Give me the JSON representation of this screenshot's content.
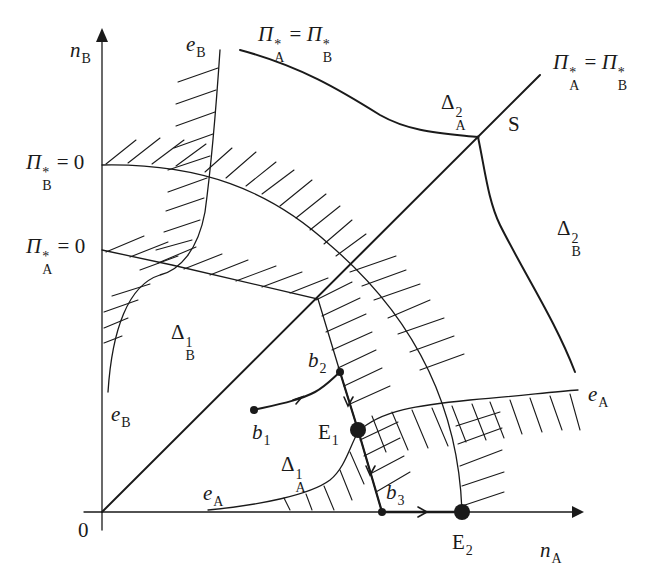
{
  "figure": {
    "type": "phase diagram",
    "axes": {
      "x": {
        "symbol": "n",
        "subscript": "A"
      },
      "y": {
        "symbol": "n",
        "subscript": "B"
      },
      "origin_label": "0"
    },
    "y_tick_labels": [
      {
        "symbol": "Π",
        "sup": "*",
        "sub": "B",
        "rhs": "= 0"
      },
      {
        "symbol": "Π",
        "sup": "*",
        "sub": "A",
        "rhs": "= 0"
      }
    ],
    "curve_labels": {
      "equal_profit_top": {
        "lhs_sub": "A",
        "rhs_sub": "B",
        "symbol": "Π",
        "sup": "*",
        "eq": "="
      },
      "equal_profit_diag": {
        "lhs_sub": "A",
        "rhs_sub": "B",
        "symbol": "Π",
        "sup": "*",
        "eq": "="
      },
      "eB_top": {
        "symbol": "e",
        "sub": "B"
      },
      "eB_bottom": {
        "symbol": "e",
        "sub": "B"
      },
      "eA_bottom": {
        "symbol": "e",
        "sub": "A"
      },
      "eA_right": {
        "symbol": "e",
        "sub": "A"
      }
    },
    "regions": [
      {
        "id": "delta_A_2",
        "symbol": "Δ",
        "sup": "2",
        "sub": "A"
      },
      {
        "id": "delta_B_2",
        "symbol": "Δ",
        "sup": "2",
        "sub": "B"
      },
      {
        "id": "delta_B_1",
        "symbol": "Δ",
        "sup": "1",
        "sub": "B"
      },
      {
        "id": "delta_A_1",
        "symbol": "Δ",
        "sup": "1",
        "sub": "A"
      }
    ],
    "points": [
      {
        "id": "S",
        "label": "S"
      },
      {
        "id": "b1",
        "symbol": "b",
        "sub": "1"
      },
      {
        "id": "b2",
        "symbol": "b",
        "sub": "2"
      },
      {
        "id": "b3",
        "symbol": "b",
        "sub": "3"
      },
      {
        "id": "E1",
        "symbol": "E",
        "sub": "1"
      },
      {
        "id": "E2",
        "symbol": "E",
        "sub": "2"
      }
    ],
    "colors": {
      "ink": "#1a1a1a",
      "background": "#ffffff"
    }
  }
}
